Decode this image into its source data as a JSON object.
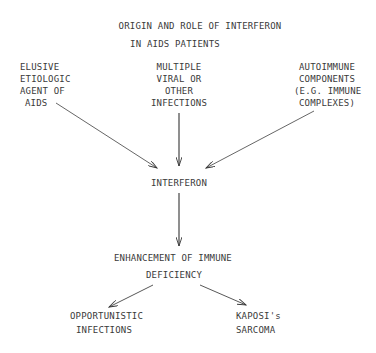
{
  "title": {
    "lines": [
      "ORIGIN AND ROLE OF INTERFERON",
      "IN AIDS PATIENTS"
    ]
  },
  "nodes": {
    "agent": {
      "lines": [
        "ELUSIVE",
        "ETIOLOGIC",
        "AGENT OF",
        "AIDS"
      ]
    },
    "infections": {
      "lines": [
        "MULTIPLE",
        "VIRAL OR",
        "OTHER",
        "INFECTIONS"
      ]
    },
    "autoimmune": {
      "lines": [
        "AUTOIMMUNE",
        "COMPONENTS",
        "(E.G. IMMUNE",
        "COMPLEXES)"
      ]
    },
    "interferon": {
      "lines": [
        "INTERFERON"
      ]
    },
    "enhancement": {
      "lines": [
        "ENHANCEMENT OF IMMUNE",
        "DEFICIENCY"
      ]
    },
    "opportunistic": {
      "lines": [
        "OPPORTUNISTIC",
        "INFECTIONS"
      ]
    },
    "kaposi": {
      "lines": [
        "KAPOSI's",
        "SARCOMA"
      ]
    }
  },
  "edges": [
    {
      "from": "agent",
      "to": "interferon"
    },
    {
      "from": "infections",
      "to": "interferon"
    },
    {
      "from": "autoimmune",
      "to": "interferon"
    },
    {
      "from": "interferon",
      "to": "enhancement"
    },
    {
      "from": "enhancement",
      "to": "opportunistic"
    },
    {
      "from": "enhancement",
      "to": "kaposi"
    }
  ],
  "colors": {
    "ink": "#3a3a3a",
    "background": "#ffffff"
  }
}
